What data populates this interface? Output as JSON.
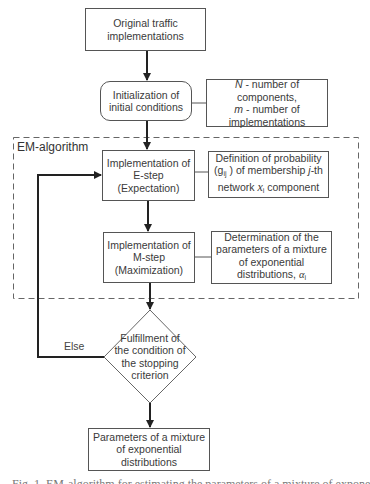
{
  "diagram": {
    "nodes": {
      "original": {
        "text": "Original traffic implementations",
        "lines": [
          "Original traffic",
          "implementations"
        ]
      },
      "init": {
        "lines": [
          "Initialization of",
          "initial conditions"
        ]
      },
      "init_note": {
        "line1_var": "N",
        "line1_rest": " - number of",
        "line2": "components,",
        "line3_var": "m",
        "line3_rest": " - number of",
        "line4": "implementations"
      },
      "em_group_label": "EM-algorithm",
      "estep": {
        "lines": [
          "Implementation of",
          "E-step",
          "(Expectation)"
        ]
      },
      "estep_note": {
        "line1": "Definition of probability",
        "line2_open": "(g",
        "line2_sub": "ij",
        "line2_close": " )  of membership ",
        "line2_var": "j",
        "line2_rest": "-th",
        "line3_pre": "network  ",
        "line3_var": "x",
        "line3_sub": "i",
        "line3_rest": "  component"
      },
      "mstep": {
        "lines": [
          "Implementation of",
          "M-step",
          "(Maximization)"
        ]
      },
      "mstep_note": {
        "line1": "Determination of the",
        "line2": "parameters of a mixture",
        "line3": "of exponential",
        "line4_pre": "distributions,  ",
        "line4_var": "α",
        "line4_sub": "i"
      },
      "decision": {
        "lines": [
          "Fulfillment of",
          "the condition of",
          "the stopping",
          "criterion"
        ]
      },
      "result": {
        "lines": [
          "Parameters of a mixture",
          "of exponential",
          "distributions"
        ]
      }
    },
    "edge_labels": {
      "else": "Else"
    },
    "caption": "Fig. 1. EM-algorithm for estimating the parameters of a mixture of exponential distributions"
  },
  "colors": {
    "line": "#333333",
    "box_border": "#555555",
    "dashed": "#666666"
  }
}
